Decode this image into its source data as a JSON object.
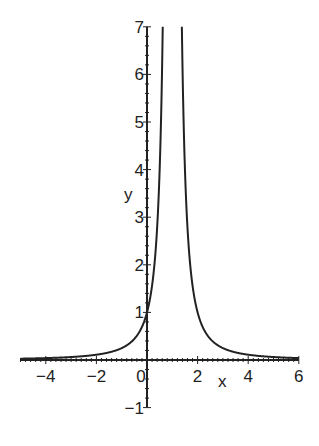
{
  "chart_data": {
    "type": "line",
    "title": "",
    "xlabel": "x",
    "ylabel": "y",
    "xlim": [
      -5,
      6
    ],
    "ylim": [
      -1,
      7
    ],
    "grid": false,
    "legend": null,
    "x_ticks": [
      "-4",
      "-2",
      "0",
      "2",
      "4",
      "6"
    ],
    "y_ticks": [
      "-1",
      "1",
      "2",
      "3",
      "4",
      "5",
      "6",
      "7"
    ],
    "function": "y = 1/(x-1)^2",
    "vertical_asymptote": 1,
    "series": [
      {
        "name": "y = 1/(x-1)^2",
        "x": [
          -5,
          -4,
          -3,
          -2,
          -1,
          -0.5,
          0,
          0.25,
          0.5,
          0.62,
          1.38,
          1.5,
          1.75,
          2,
          2.5,
          3,
          4,
          5,
          6
        ],
        "y": [
          0.028,
          0.04,
          0.0625,
          0.111,
          0.25,
          0.444,
          1,
          1.778,
          4,
          7,
          7,
          4,
          1.778,
          1,
          0.444,
          0.25,
          0.111,
          0.0625,
          0.04
        ]
      }
    ],
    "colors": {
      "curve": "#222222",
      "axes": "#222222",
      "background": "#ffffff"
    }
  }
}
